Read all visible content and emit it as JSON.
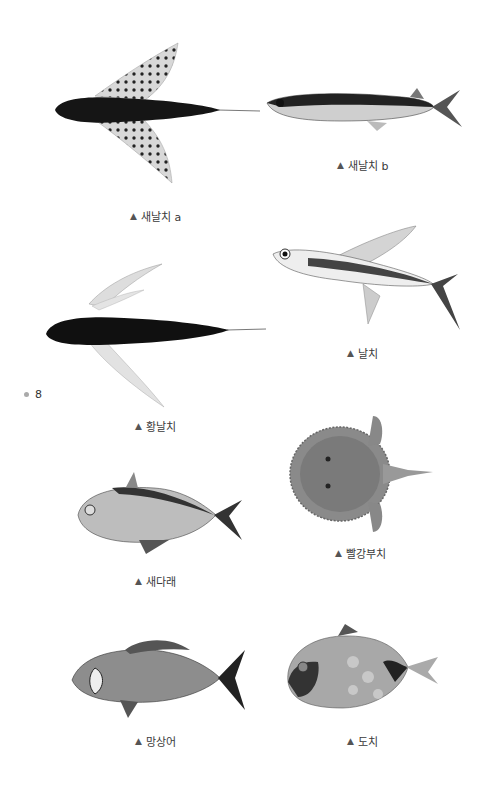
{
  "page": {
    "page_number": "8",
    "marker_icon": "bullet-dot",
    "caption_icon": "▲"
  },
  "figures": [
    {
      "id": "flyingfish-a",
      "caption": "새날치 a"
    },
    {
      "id": "flyingfish-b",
      "caption": "새날치 b"
    },
    {
      "id": "flyingfish",
      "caption": "날치"
    },
    {
      "id": "hwang-flyingfish",
      "caption": "황날치"
    },
    {
      "id": "pomfret",
      "caption": "새다래"
    },
    {
      "id": "batfish",
      "caption": "빨강부치"
    },
    {
      "id": "seabream",
      "caption": "망상어"
    },
    {
      "id": "lumpsucker",
      "caption": "도치"
    }
  ]
}
